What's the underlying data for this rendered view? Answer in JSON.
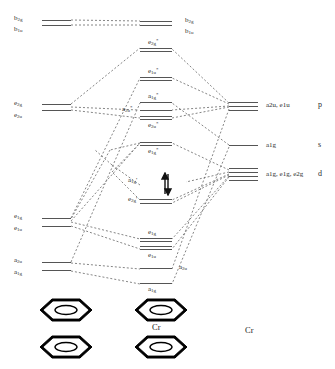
{
  "diagram": {
    "center_molecule_label": "Cr",
    "right_atom_label": "Cr",
    "line_color": "#555555",
    "text_color": "#2b2b2b",
    "ring_color": "#000000"
  },
  "ligand_levels": [
    {
      "id": "lig-b2g-b1u",
      "labels": [
        "b",
        "b"
      ],
      "label_text": "b2g / b1u",
      "sub": [
        "2g",
        "1u"
      ],
      "x": 42,
      "y": 20,
      "lines": 2
    },
    {
      "id": "lig-e2g-e2u",
      "labels": [
        "e",
        "e"
      ],
      "label_text": "e2g / e2u",
      "x": 42,
      "y": 105,
      "lines": 2
    },
    {
      "id": "lig-e1g-e1u",
      "labels": [
        "e",
        "e"
      ],
      "label_text": "e1g / e1u",
      "x": 42,
      "y": 218,
      "lines": 2
    },
    {
      "id": "lig-a2u-a1g",
      "labels": [
        "a",
        "a"
      ],
      "label_text": "a2u / a1g",
      "x": 42,
      "y": 263,
      "lines": 2
    }
  ],
  "ligand_labels": [
    {
      "text": "b",
      "sub": "2g",
      "x": 14,
      "y": 16
    },
    {
      "text": "b",
      "sub": "1u",
      "x": 14,
      "y": 27
    },
    {
      "text": "e",
      "sub": "2g",
      "x": 14,
      "y": 101
    },
    {
      "text": "e",
      "sub": "2u",
      "x": 14,
      "y": 113
    },
    {
      "text": "e",
      "sub": "1g",
      "x": 14,
      "y": 214
    },
    {
      "text": "e",
      "sub": "1u",
      "x": 14,
      "y": 226
    },
    {
      "text": "a",
      "sub": "2u",
      "x": 14,
      "y": 258
    },
    {
      "text": "a",
      "sub": "1g",
      "x": 14,
      "y": 270
    }
  ],
  "mo_levels": [
    {
      "id": "mo-b2g-b1u",
      "label": "b2g, b1u",
      "x": 155,
      "y": 22,
      "lines": 2,
      "label_pos": "right"
    },
    {
      "id": "mo-e2g-star",
      "label": "e2g*",
      "base": "e",
      "sub": "2g",
      "star": true,
      "x": 155,
      "y": 48,
      "lines": 2
    },
    {
      "id": "mo-e1u-star",
      "label": "e1u*",
      "base": "e",
      "sub": "1u",
      "star": true,
      "x": 155,
      "y": 77,
      "lines": 2
    },
    {
      "id": "mo-a1g-star",
      "label": "a1g*",
      "base": "a",
      "sub": "1g",
      "star": true,
      "x": 155,
      "y": 102,
      "lines": 1
    },
    {
      "id": "mo-a2u-star",
      "label": "a2u*",
      "base": "a",
      "sub": "2u",
      "star": true,
      "x": 155,
      "y": 110,
      "lines": 1
    },
    {
      "id": "mo-e2u-star",
      "label": "e2u*",
      "base": "e",
      "sub": "2u",
      "star": true,
      "x": 155,
      "y": 117,
      "lines": 2
    },
    {
      "id": "mo-e1g-star",
      "label": "e1g*",
      "base": "e",
      "sub": "1g",
      "star": true,
      "x": 155,
      "y": 142,
      "lines": 2
    },
    {
      "id": "mo-a1g-prime",
      "label": "a1g'",
      "base": "a",
      "sub": "1g",
      "prime": true,
      "x": 158,
      "y": 182,
      "lines": 1,
      "occupied": true
    },
    {
      "id": "mo-e2g-prime",
      "label": "e2g'",
      "base": "e",
      "sub": "2g",
      "prime": true,
      "x": 155,
      "y": 199,
      "lines": 2
    },
    {
      "id": "mo-e1g",
      "label": "e1g",
      "base": "e",
      "sub": "1g",
      "x": 155,
      "y": 238,
      "lines": 2
    },
    {
      "id": "mo-e1u",
      "label": "e1u",
      "base": "e",
      "sub": "1u",
      "x": 155,
      "y": 248,
      "lines": 2
    },
    {
      "id": "mo-a2u",
      "label": "a2u",
      "base": "a",
      "sub": "2u",
      "x": 155,
      "y": 268,
      "lines": 1
    },
    {
      "id": "mo-a1g-bond",
      "label": "a1g",
      "base": "a",
      "sub": "1g",
      "x": 155,
      "y": 283,
      "lines": 1
    }
  ],
  "mo_labels": [
    {
      "text": "b",
      "sub": "2g",
      "x": 185,
      "y": 18
    },
    {
      "text": "b",
      "sub": "1u",
      "x": 185,
      "y": 29
    },
    {
      "text": "e",
      "sub": "2g",
      "star": "*",
      "x": 148,
      "y": 40
    },
    {
      "text": "e",
      "sub": "1u",
      "star": "*",
      "x": 148,
      "y": 69
    },
    {
      "text": "a",
      "sub": "1g",
      "star": "*",
      "x": 148,
      "y": 94
    },
    {
      "text": "a",
      "sub": "2u",
      "star": "*",
      "x": 124,
      "y": 107
    },
    {
      "text": "e",
      "sub": "2u",
      "star": "*",
      "x": 148,
      "y": 122
    },
    {
      "text": "e",
      "sub": "1g",
      "star": "*",
      "x": 148,
      "y": 147
    },
    {
      "text": "a",
      "sub": "1g",
      "prime": "'",
      "x": 128,
      "y": 178
    },
    {
      "text": "e",
      "sub": "2g",
      "prime": "'",
      "x": 128,
      "y": 196
    },
    {
      "text": "e",
      "sub": "1g",
      "x": 148,
      "y": 231
    },
    {
      "text": "e",
      "sub": "1u",
      "x": 148,
      "y": 254
    },
    {
      "text": "a",
      "sub": "2u",
      "x": 182,
      "y": 266
    },
    {
      "text": "a",
      "sub": "1g",
      "x": 148,
      "y": 286
    }
  ],
  "metal_levels": [
    {
      "id": "metal-p",
      "label": "a2u, e1u",
      "shell": "p",
      "x": 248,
      "y": 105,
      "lines": 3
    },
    {
      "id": "metal-s",
      "label": "a1g",
      "shell": "s",
      "x": 248,
      "y": 145,
      "lines": 1
    },
    {
      "id": "metal-d",
      "label": "a1g, e1g, e2g",
      "shell": "d",
      "x": 248,
      "y": 172,
      "lines": 4
    }
  ],
  "metal_labels": [
    {
      "text": "a2u, e1u",
      "x": 283,
      "y": 102
    },
    {
      "text": "a1g",
      "x": 283,
      "y": 142
    },
    {
      "text": "a1g, e1g, e2g",
      "x": 283,
      "y": 170
    }
  ],
  "shell_labels": [
    {
      "text": "p",
      "x": 322,
      "y": 102
    },
    {
      "text": "s",
      "x": 322,
      "y": 142
    },
    {
      "text": "d",
      "x": 322,
      "y": 170
    }
  ],
  "molecule_labels": [
    {
      "text": "a1g",
      "x": 148,
      "y": 288
    },
    {
      "text": "Cr",
      "x": 152,
      "y": 325
    },
    {
      "text": "Cr",
      "x": 248,
      "y": 330
    }
  ]
}
